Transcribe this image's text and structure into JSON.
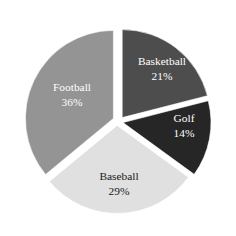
{
  "chart_data": {
    "type": "pie",
    "title": "",
    "subtitle": "",
    "xlabel": "",
    "ylabel": "",
    "grid": false,
    "legend": "none",
    "labels_inside_slices": true,
    "start_angle_deg": 0,
    "direction": "clockwise",
    "exploded": true,
    "background_color": "#ffffff",
    "categories": [
      "Basketball",
      "Golf",
      "Baseball",
      "Football"
    ],
    "values": [
      21,
      14,
      29,
      36
    ],
    "value_unit": "%",
    "slices": [
      {
        "name": "Basketball",
        "value": 21,
        "value_label": "21%",
        "color": "#4d4d4d",
        "text_color": "#ffffff",
        "start_deg": 0,
        "end_deg": 75.6,
        "label_x": 162,
        "label_y": 62,
        "value_x": 162,
        "value_y": 77,
        "explode_x": 4.2,
        "explode_y": -2.4
      },
      {
        "name": "Golf",
        "value": 14,
        "value_label": "14%",
        "color": "#262626",
        "text_color": "#ffffff",
        "start_deg": 75.6,
        "end_deg": 126.0,
        "label_x": 184,
        "label_y": 119,
        "value_x": 184,
        "value_y": 134,
        "explode_x": 5.0,
        "explode_y": 2.6
      },
      {
        "name": "Baseball",
        "value": 29,
        "value_label": "29%",
        "color": "#e0e0e0",
        "text_color": "#1a1a1a",
        "start_deg": 126.0,
        "end_deg": 230.4,
        "label_x": 119,
        "label_y": 177,
        "value_x": 119,
        "value_y": 192,
        "explode_x": -0.8,
        "explode_y": 5.4
      },
      {
        "name": "Football",
        "value": 36,
        "value_label": "36%",
        "color": "#949494",
        "text_color": "#ffffff",
        "start_deg": 230.4,
        "end_deg": 360.0,
        "label_x": 72,
        "label_y": 88,
        "value_x": 72,
        "value_y": 103,
        "explode_x": -4.6,
        "explode_y": -1.6
      }
    ],
    "geometry": {
      "center_x": 118,
      "center_y": 120,
      "radius": 88
    }
  }
}
